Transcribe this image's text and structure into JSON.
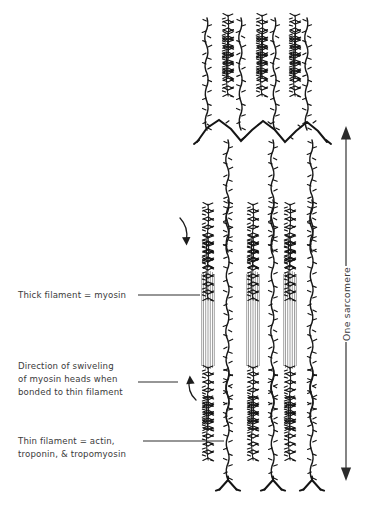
{
  "figure": {
    "title_visible": false,
    "background_color": "#ffffff",
    "ink_color": "#1a1a1a",
    "text_color": "#3a3a3a"
  },
  "labels": {
    "thick_filament": {
      "lines": [
        "Thick filament = myosin"
      ],
      "leader": true
    },
    "swiveling": {
      "lines": [
        "Direction of swiveling",
        "of myosin heads when",
        "bonded to thin filament"
      ],
      "leader": true
    },
    "thin_filament": {
      "lines": [
        "Thin filament = actin,",
        "troponin, & tropomyosin"
      ],
      "leader": true
    },
    "sarcomere": {
      "text": "One sarcomere",
      "orientation": "vertical",
      "arrow": "double-headed"
    }
  },
  "structures": {
    "z_line_top": {
      "name": "Z-line (top)",
      "shape": "zigzag"
    },
    "z_line_bottom": {
      "name": "Z-line (bottom)",
      "shape": "y-branch"
    },
    "thick_filaments": {
      "count": 3,
      "name": "myosin thick filament"
    },
    "thin_filaments_upper": {
      "count": 3,
      "name": "actin thin filament"
    },
    "thin_filaments_lower": {
      "count": 3,
      "name": "actin thin filament"
    },
    "swivel_arrow_upper": {
      "name": "downward swivel arrow"
    },
    "swivel_arrow_lower": {
      "name": "upward swivel arrow"
    }
  }
}
